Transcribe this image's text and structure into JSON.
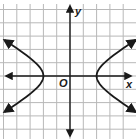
{
  "figure": {
    "type": "coordinate-graph",
    "labels": {
      "x_axis": "x",
      "y_axis": "y",
      "origin": "O"
    },
    "grid": {
      "cell_px": 13.3,
      "origin_px": [
        70,
        76
      ],
      "x_range_units": [
        -5,
        5
      ],
      "y_range_units": [
        -5,
        5
      ]
    },
    "curve": {
      "kind": "hyperbola",
      "orientation": "horizontal",
      "center": [
        0,
        0
      ],
      "vertices": [
        [
          -2,
          0
        ],
        [
          2,
          0
        ]
      ],
      "branch_arrow_points": [
        [
          -4.6,
          2.4
        ],
        [
          -4.6,
          -2.2
        ],
        [
          4.3,
          2.4
        ],
        [
          4.3,
          -2.1
        ]
      ]
    },
    "colors": {
      "grid": "#b8b8b8",
      "axis": "#1a1a1a",
      "curve": "#1a1a1a",
      "background": "#ffffff"
    }
  }
}
